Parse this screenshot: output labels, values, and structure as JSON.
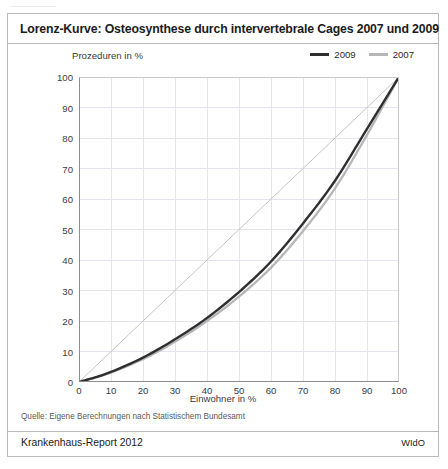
{
  "figure": {
    "title": "Lorenz-Kurve: Osteosynthese durch intervertebrale Cages 2007 und 2009",
    "source_note": "Quelle: Eigene Berechnungen nach Statistischem Bundesamt",
    "footer_left": "Krankenhaus-Report 2012",
    "footer_right": "WIdO"
  },
  "colors": {
    "series_2009": "#2f2f2f",
    "series_2007": "#b6b6b6",
    "equality_line": "#c4c4c4",
    "grid": "#e4e4ef",
    "axis": "#8d8d8d",
    "frame": "#b9b9b9",
    "title_text": "#1b1b1b",
    "tick_text": "#3b3b3b"
  },
  "chart_data": {
    "type": "line",
    "title": "Lorenz-Kurve: Osteosynthese durch intervertebrale Cages 2007 und 2009",
    "xlabel": "Einwohner in %",
    "ylabel": "Prozeduren in %",
    "xlim": [
      0,
      100
    ],
    "ylim": [
      0,
      100
    ],
    "xticks": [
      0,
      10,
      20,
      30,
      40,
      50,
      60,
      70,
      80,
      90,
      100
    ],
    "yticks": [
      0,
      10,
      20,
      30,
      40,
      50,
      60,
      70,
      80,
      90,
      100
    ],
    "grid": true,
    "legend_position": "top-right",
    "x": [
      0,
      5,
      10,
      20,
      30,
      40,
      50,
      60,
      70,
      80,
      90,
      95,
      100
    ],
    "series": [
      {
        "name": "2009",
        "color": "#2f2f2f",
        "values": [
          0,
          1.5,
          3.3,
          8.0,
          14.0,
          21.0,
          29.5,
          39.5,
          52.0,
          66.0,
          83.0,
          91.5,
          100
        ]
      },
      {
        "name": "2007",
        "color": "#b6b6b6",
        "values": [
          0,
          1.4,
          3.1,
          7.5,
          13.2,
          20.0,
          28.0,
          37.5,
          49.5,
          63.5,
          81.0,
          90.5,
          100
        ]
      },
      {
        "name": "Gleichverteilung",
        "color": "#c4c4c4",
        "values": [
          0,
          5,
          10,
          20,
          30,
          40,
          50,
          60,
          70,
          80,
          90,
          95,
          100
        ]
      }
    ]
  },
  "legend": {
    "items": [
      {
        "label": "2009",
        "color": "#2f2f2f"
      },
      {
        "label": "2007",
        "color": "#b6b6b6"
      }
    ]
  }
}
